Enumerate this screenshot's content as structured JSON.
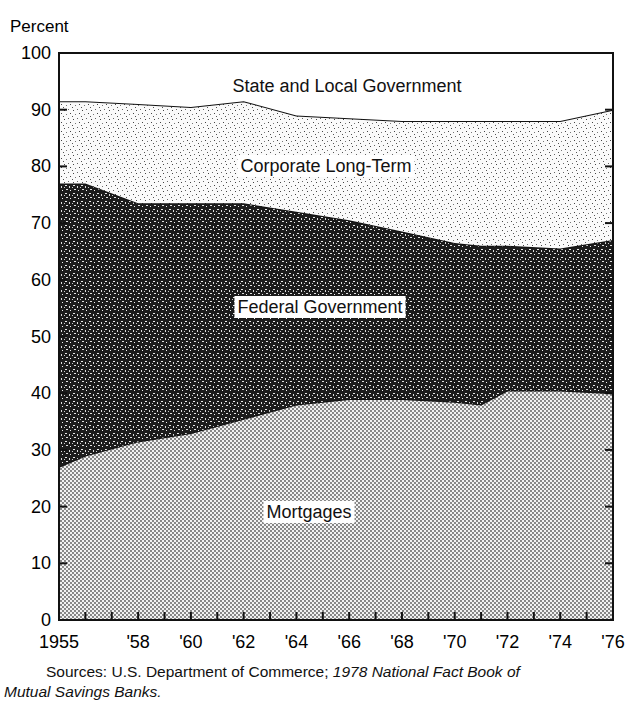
{
  "chart_data": {
    "type": "area",
    "stacked": true,
    "title": "",
    "ylabel": "Percent",
    "xlabel": "",
    "ylim": [
      0,
      100
    ],
    "yticks": [
      0,
      10,
      20,
      30,
      40,
      50,
      60,
      70,
      80,
      90,
      100
    ],
    "xtick_labels": [
      "1955",
      "'58",
      "'60",
      "'62",
      "'64",
      "'66",
      "'68",
      "'70",
      "'72",
      "'74",
      "'76"
    ],
    "x": [
      1955,
      1956,
      1958,
      1960,
      1962,
      1964,
      1966,
      1968,
      1970,
      1971,
      1972,
      1974,
      1976
    ],
    "series": [
      {
        "name": "Mortgages",
        "values": [
          27,
          29,
          31.5,
          33,
          35.5,
          38,
          39,
          39,
          38.5,
          38,
          40.5,
          40.5,
          40
        ]
      },
      {
        "name": "Federal Government",
        "values": [
          50,
          48,
          42,
          40.5,
          38,
          34,
          31.5,
          29.5,
          28,
          28,
          25.5,
          25,
          27
        ]
      },
      {
        "name": "Corporate Long-Term",
        "values": [
          14.5,
          14.5,
          17.5,
          17,
          18,
          17,
          18,
          19.5,
          21.5,
          22,
          22,
          22.5,
          23
        ]
      },
      {
        "name": "State and Local Government",
        "values": [
          8.5,
          8.5,
          9,
          9.5,
          8.5,
          11,
          11.5,
          12,
          12,
          12,
          12,
          12,
          10
        ]
      }
    ],
    "boundaries_cumulative": {
      "mortgages_top": [
        27,
        29,
        31.5,
        33,
        35.5,
        38,
        39,
        39,
        38.5,
        38,
        40.5,
        40.5,
        40
      ],
      "federal_top": [
        77,
        77,
        73.5,
        73.5,
        73.5,
        72,
        70.5,
        68.5,
        66.5,
        66,
        66,
        65.5,
        67
      ],
      "corporate_top": [
        91.5,
        91.5,
        91,
        90.5,
        89.5,
        89,
        88.5,
        88,
        88,
        88,
        88,
        88,
        90
      ]
    },
    "series_labels": {
      "state_local": "State and Local Government",
      "corporate": "Corporate Long-Term",
      "federal": "Federal Government",
      "mortgages": "Mortgages"
    },
    "legend": "inline labels",
    "grid": false
  },
  "source_note": {
    "prefix": "Sources: U.S. Department of Commerce; ",
    "italic_part1": "1978 National Fact Book of",
    "italic_part2": "Mutual Savings Banks."
  }
}
